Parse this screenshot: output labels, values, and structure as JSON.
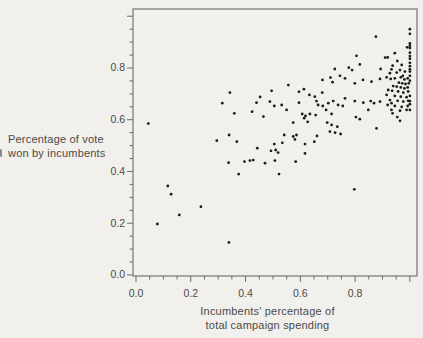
{
  "figure": {
    "background_color": "#f2f0ec",
    "axis_color": "#6b6b6b",
    "text_color": "#4a4a4a",
    "dot_color": "#1c1c1c",
    "ylabel_line1": "Percentage of vote",
    "ylabel_line2": "won by incumbents",
    "xlabel_line1": "Incumbents' percentage of",
    "xlabel_line2": "total campaign spending"
  },
  "chart_data": {
    "type": "scatter",
    "title": "",
    "xlabel": "Incumbents' percentage of total campaign spending",
    "ylabel": "Percentage of vote won by incumbents",
    "xlim": [
      -0.011,
      1.026
    ],
    "ylim": [
      -0.004,
      1.028
    ],
    "grid": false,
    "legend": null,
    "x_ticks_major": [
      0.0,
      0.2,
      0.4,
      0.6,
      0.8,
      1.0
    ],
    "x_tick_labels": [
      "0.0",
      "0.2",
      "0.4",
      "0.6",
      "0.8"
    ],
    "y_ticks_major": [
      0.0,
      0.2,
      0.4,
      0.6,
      0.8,
      1.0
    ],
    "y_tick_labels": [
      "0.0",
      "0.2",
      "0.4",
      "0.6",
      "0.8"
    ],
    "minor_tick_step": 0.05,
    "points": [
      [
        0.045,
        0.585
      ],
      [
        0.078,
        0.197
      ],
      [
        0.116,
        0.344
      ],
      [
        0.128,
        0.312
      ],
      [
        0.158,
        0.232
      ],
      [
        0.237,
        0.264
      ],
      [
        0.295,
        0.519
      ],
      [
        0.315,
        0.664
      ],
      [
        0.338,
        0.434
      ],
      [
        0.339,
        0.126
      ],
      [
        0.34,
        0.541
      ],
      [
        0.343,
        0.705
      ],
      [
        0.359,
        0.625
      ],
      [
        0.368,
        0.515
      ],
      [
        0.375,
        0.39
      ],
      [
        0.396,
        0.438
      ],
      [
        0.416,
        0.442
      ],
      [
        0.424,
        0.631
      ],
      [
        0.428,
        0.444
      ],
      [
        0.44,
        0.666
      ],
      [
        0.443,
        0.49
      ],
      [
        0.453,
        0.688
      ],
      [
        0.465,
        0.612
      ],
      [
        0.471,
        0.432
      ],
      [
        0.489,
        0.67
      ],
      [
        0.493,
        0.48
      ],
      [
        0.495,
        0.712
      ],
      [
        0.505,
        0.653
      ],
      [
        0.505,
        0.506
      ],
      [
        0.507,
        0.442
      ],
      [
        0.51,
        0.483
      ],
      [
        0.519,
        0.473
      ],
      [
        0.522,
        0.39
      ],
      [
        0.532,
        0.657
      ],
      [
        0.534,
        0.511
      ],
      [
        0.541,
        0.541
      ],
      [
        0.55,
        0.638
      ],
      [
        0.556,
        0.734
      ],
      [
        0.574,
        0.589
      ],
      [
        0.574,
        0.535
      ],
      [
        0.58,
        0.524
      ],
      [
        0.583,
        0.438
      ],
      [
        0.586,
        0.541
      ],
      [
        0.595,
        0.708
      ],
      [
        0.595,
        0.666
      ],
      [
        0.607,
        0.622
      ],
      [
        0.613,
        0.718
      ],
      [
        0.614,
        0.606
      ],
      [
        0.617,
        0.506
      ],
      [
        0.617,
        0.47
      ],
      [
        0.619,
        0.615
      ],
      [
        0.627,
        0.592
      ],
      [
        0.633,
        0.696
      ],
      [
        0.635,
        0.622
      ],
      [
        0.651,
        0.515
      ],
      [
        0.653,
        0.689
      ],
      [
        0.656,
        0.618
      ],
      [
        0.659,
        0.672
      ],
      [
        0.661,
        0.537
      ],
      [
        0.665,
        0.657
      ],
      [
        0.68,
        0.705
      ],
      [
        0.681,
        0.754
      ],
      [
        0.682,
        0.653
      ],
      [
        0.694,
        0.638
      ],
      [
        0.698,
        0.589
      ],
      [
        0.702,
        0.664
      ],
      [
        0.708,
        0.554
      ],
      [
        0.71,
        0.763
      ],
      [
        0.714,
        0.622
      ],
      [
        0.714,
        0.58
      ],
      [
        0.718,
        0.745
      ],
      [
        0.72,
        0.672
      ],
      [
        0.726,
        0.796
      ],
      [
        0.727,
        0.55
      ],
      [
        0.735,
        0.573
      ],
      [
        0.738,
        0.657
      ],
      [
        0.745,
        0.77
      ],
      [
        0.747,
        0.545
      ],
      [
        0.755,
        0.653
      ],
      [
        0.763,
        0.76
      ],
      [
        0.763,
        0.683
      ],
      [
        0.777,
        0.801
      ],
      [
        0.789,
        0.792
      ],
      [
        0.797,
        0.331
      ],
      [
        0.799,
        0.741
      ],
      [
        0.799,
        0.672
      ],
      [
        0.803,
        0.61
      ],
      [
        0.805,
        0.847
      ],
      [
        0.817,
        0.814
      ],
      [
        0.817,
        0.602
      ],
      [
        0.829,
        0.754
      ],
      [
        0.83,
        0.666
      ],
      [
        0.848,
        0.638
      ],
      [
        0.857,
        0.672
      ],
      [
        0.86,
        0.747
      ],
      [
        0.869,
        0.664
      ],
      [
        0.876,
        0.921
      ],
      [
        0.878,
        0.567
      ],
      [
        0.891,
        0.758
      ],
      [
        0.891,
        0.67
      ],
      [
        0.893,
        0.796
      ],
      [
        0.91,
        0.84
      ],
      [
        0.915,
        0.764
      ],
      [
        0.915,
        0.696
      ],
      [
        0.919,
        0.841
      ],
      [
        0.919,
        0.657
      ],
      [
        0.921,
        0.715
      ],
      [
        0.927,
        0.78
      ],
      [
        0.927,
        0.676
      ],
      [
        0.93,
        0.758
      ],
      [
        0.933,
        0.795
      ],
      [
        0.933,
        0.664
      ],
      [
        0.933,
        0.638
      ],
      [
        0.935,
        0.712
      ],
      [
        0.937,
        0.809
      ],
      [
        0.937,
        0.625
      ],
      [
        0.939,
        0.73
      ],
      [
        0.945,
        0.857
      ],
      [
        0.945,
        0.76
      ],
      [
        0.945,
        0.692
      ],
      [
        0.945,
        0.653
      ],
      [
        0.952,
        0.782
      ],
      [
        0.952,
        0.728
      ],
      [
        0.954,
        0.827
      ],
      [
        0.954,
        0.61
      ],
      [
        0.955,
        0.673
      ],
      [
        0.957,
        0.709
      ],
      [
        0.96,
        0.743
      ],
      [
        0.964,
        0.792
      ],
      [
        0.964,
        0.635
      ],
      [
        0.964,
        0.596
      ],
      [
        0.967,
        0.764
      ],
      [
        0.967,
        0.725
      ],
      [
        0.967,
        0.689
      ],
      [
        0.97,
        0.812
      ],
      [
        0.97,
        0.65
      ],
      [
        0.972,
        0.741
      ],
      [
        0.974,
        0.77
      ],
      [
        0.976,
        0.705
      ],
      [
        0.976,
        0.67
      ],
      [
        0.98,
        0.756
      ],
      [
        0.98,
        0.721
      ],
      [
        0.982,
        0.786
      ],
      [
        0.984,
        0.738
      ],
      [
        0.988,
        0.687
      ],
      [
        0.988,
        0.638
      ],
      [
        0.99,
        0.88
      ],
      [
        0.992,
        0.76
      ],
      [
        0.992,
        0.725
      ],
      [
        0.992,
        0.653
      ],
      [
        0.994,
        0.709
      ],
      [
        0.994,
        0.673
      ],
      [
        0.996,
        0.741
      ],
      [
        1.0,
        0.95
      ],
      [
        1.0,
        0.932
      ],
      [
        1.0,
        0.895
      ],
      [
        1.0,
        0.886
      ],
      [
        1.0,
        0.877
      ],
      [
        1.0,
        0.859
      ],
      [
        1.0,
        0.846
      ],
      [
        1.0,
        0.836
      ],
      [
        1.0,
        0.82
      ],
      [
        1.0,
        0.807
      ],
      [
        1.0,
        0.795
      ],
      [
        1.0,
        0.786
      ],
      [
        1.0,
        0.77
      ],
      [
        1.0,
        0.751
      ],
      [
        1.0,
        0.692
      ],
      [
        1.0,
        0.672
      ],
      [
        1.0,
        0.66
      ],
      [
        1.0,
        0.638
      ]
    ]
  }
}
